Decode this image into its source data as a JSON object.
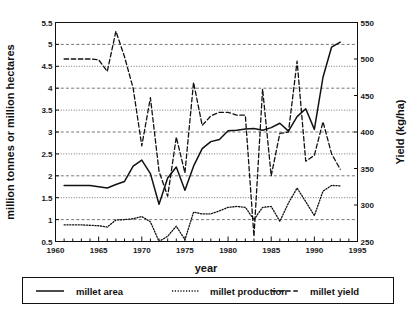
{
  "chart_data": {
    "type": "line",
    "title": "",
    "xlabel": "year",
    "ylabel": "million tonnes or million hectares",
    "y2label": "Yield (kg/ha)",
    "xlim": [
      1960,
      1995
    ],
    "ylim": [
      0.5,
      5.5
    ],
    "y2lim": [
      250,
      550
    ],
    "xticks": [
      1960,
      1965,
      1970,
      1975,
      1980,
      1985,
      1990,
      1995
    ],
    "xtick_labels": [
      "1960",
      "1965",
      "1970",
      "1975",
      "1980",
      "1985",
      "1990",
      "1995"
    ],
    "xminor_step": 1,
    "yticks": [
      0.5,
      1,
      1.5,
      2,
      2.5,
      3,
      3.5,
      4,
      4.5,
      5,
      5.5
    ],
    "ytick_labels": [
      "0.5",
      "1",
      "1.5",
      "2",
      "2.5",
      "3",
      "3.5",
      "4",
      "4.5",
      "5",
      "5.5"
    ],
    "y2ticks": [
      250,
      300,
      350,
      400,
      450,
      500,
      550
    ],
    "y2tick_labels": [
      "250",
      "300",
      "350",
      "400",
      "450",
      "500",
      "550"
    ],
    "grid": true,
    "grid_axis": "y",
    "legend_position": "bottom",
    "legend_entries": [
      "millet area",
      "millet production",
      "millet yield"
    ],
    "series": [
      {
        "name": "millet area",
        "axis": "left",
        "style": "solid",
        "color": "#111111",
        "x": [
          1961,
          1962,
          1963,
          1964,
          1965,
          1966,
          1967,
          1968,
          1969,
          1970,
          1971,
          1972,
          1973,
          1974,
          1975,
          1976,
          1977,
          1978,
          1979,
          1980,
          1981,
          1982,
          1983,
          1984,
          1985,
          1986,
          1987,
          1988,
          1989,
          1990,
          1991,
          1992,
          1993
        ],
        "values": [
          1.78,
          1.78,
          1.78,
          1.78,
          1.75,
          1.72,
          1.8,
          1.87,
          2.22,
          2.36,
          2.05,
          1.35,
          1.95,
          2.2,
          1.67,
          2.22,
          2.62,
          2.78,
          2.83,
          3.03,
          3.04,
          3.07,
          3.08,
          3.04,
          3.1,
          3.2,
          3.02,
          3.35,
          3.53,
          3.06,
          4.25,
          4.94,
          5.05
        ]
      },
      {
        "name": "millet production",
        "axis": "left",
        "style": "dotted",
        "color": "#111111",
        "x": [
          1961,
          1962,
          1963,
          1964,
          1965,
          1966,
          1967,
          1968,
          1969,
          1970,
          1971,
          1972,
          1973,
          1974,
          1975,
          1976,
          1977,
          1978,
          1979,
          1980,
          1981,
          1982,
          1983,
          1984,
          1985,
          1986,
          1987,
          1988,
          1989,
          1990,
          1991,
          1992,
          1993
        ],
        "values": [
          0.88,
          0.88,
          0.88,
          0.87,
          0.86,
          0.83,
          0.99,
          1.0,
          1.02,
          1.07,
          0.95,
          0.5,
          0.62,
          0.85,
          0.54,
          1.17,
          1.13,
          1.13,
          1.2,
          1.28,
          1.3,
          1.28,
          1.0,
          1.28,
          1.3,
          0.96,
          1.38,
          1.72,
          1.41,
          1.09,
          1.65,
          1.78,
          1.77
        ]
      },
      {
        "name": "millet yield",
        "axis": "right",
        "style": "dashed",
        "color": "#111111",
        "x": [
          1961,
          1962,
          1963,
          1964,
          1965,
          1966,
          1967,
          1968,
          1969,
          1970,
          1971,
          1972,
          1973,
          1974,
          1975,
          1976,
          1977,
          1978,
          1979,
          1980,
          1981,
          1982,
          1983,
          1984,
          1985,
          1986,
          1987,
          1988,
          1989,
          1990,
          1991,
          1992,
          1993
        ],
        "values_left_scale": [
          4.65,
          4.65,
          4.65,
          4.65,
          4.62,
          4.36,
          5.3,
          4.72,
          4.0,
          2.68,
          3.78,
          2.1,
          1.53,
          2.88,
          2.06,
          4.13,
          3.14,
          3.36,
          3.44,
          3.45,
          3.38,
          3.38,
          0.6,
          3.98,
          2.0,
          2.96,
          2.99,
          4.6,
          2.34,
          2.47,
          3.24,
          2.5,
          2.15
        ],
        "values": [
          500,
          500,
          500,
          500,
          499,
          483,
          538,
          503,
          460,
          381,
          447,
          346,
          312,
          393,
          344,
          468,
          409,
          422,
          427,
          427,
          423,
          423,
          257,
          459,
          340,
          398,
          400,
          497,
          360,
          368,
          414,
          370,
          349
        ]
      }
    ]
  },
  "legend": {
    "items": [
      {
        "label": "millet area",
        "style": "solid"
      },
      {
        "label": "millet production",
        "style": "dotted"
      },
      {
        "label": "millet yield",
        "style": "dashed"
      }
    ]
  },
  "axes": {
    "left_title": "million tonnes or million hectares",
    "right_title": "Yield (kg/ha)",
    "bottom_title": "year"
  },
  "colors": {
    "line": "#111111",
    "grid": "#555555",
    "frame": "#111111",
    "background": "#ffffff"
  }
}
